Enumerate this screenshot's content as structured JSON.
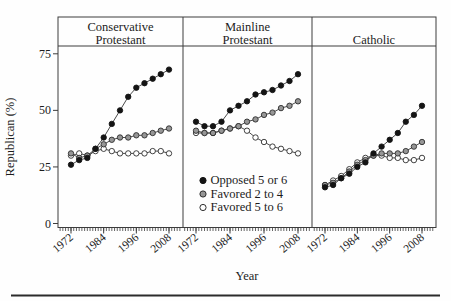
{
  "figure": {
    "xlabel": "Year",
    "ylabel": "Republican (%)"
  },
  "chart_data": {
    "type": "line",
    "x": [
      1972,
      1975,
      1978,
      1981,
      1984,
      1987,
      1990,
      1993,
      1996,
      1999,
      2002,
      2005,
      2008
    ],
    "xlabel": "Year",
    "ylabel": "Republican (%)",
    "ylim": [
      0,
      80
    ],
    "yticks": [
      0,
      25,
      50,
      75
    ],
    "xtick_years": [
      1972,
      1984,
      1996,
      2008
    ],
    "grid": false,
    "legend_position": "inside-middle-panel-lower-half",
    "legend": [
      {
        "label": "Opposed 5 or 6",
        "marker": "filled-black"
      },
      {
        "label": "Favored 2 to 4",
        "marker": "filled-gray"
      },
      {
        "label": "Favored 5 to 6",
        "marker": "open-white"
      }
    ],
    "panels": [
      {
        "title_lines": [
          "Conservative",
          "Protestant"
        ],
        "series": [
          {
            "name": "Opposed 5 or 6",
            "values": [
              26,
              28,
              29,
              33,
              38,
              44,
              50,
              56,
              60,
              62,
              64,
              66,
              68
            ]
          },
          {
            "name": "Favored 2 to 4",
            "values": [
              31,
              29,
              30,
              33,
              35,
              37,
              38,
              38,
              39,
              39,
              40,
              41,
              42
            ]
          },
          {
            "name": "Favored 5 to 6",
            "values": [
              30,
              31,
              30,
              32,
              33,
              32,
              31,
              31,
              31,
              31,
              32,
              32,
              31
            ]
          }
        ]
      },
      {
        "title_lines": [
          "Mainline",
          "Protestant"
        ],
        "series": [
          {
            "name": "Opposed 5 or 6",
            "values": [
              45,
              43,
              43,
              45,
              50,
              52,
              54,
              57,
              58,
              59,
              61,
              63,
              66
            ]
          },
          {
            "name": "Favored 2 to 4",
            "values": [
              41,
              40,
              40,
              41,
              42,
              43,
              45,
              46,
              48,
              49,
              51,
              52,
              54
            ]
          },
          {
            "name": "Favored 5 to 6",
            "values": [
              40,
              40,
              40,
              41,
              42,
              43,
              41,
              38,
              36,
              34,
              33,
              32,
              31
            ]
          }
        ]
      },
      {
        "title_lines": [
          "Catholic"
        ],
        "series": [
          {
            "name": "Opposed 5 or 6",
            "values": [
              16,
              17,
              20,
              22,
              25,
              27,
              31,
              34,
              37,
              40,
              45,
              48,
              52
            ]
          },
          {
            "name": "Favored 2 to 4",
            "values": [
              17,
              18,
              20,
              23,
              26,
              28,
              30,
              31,
              31,
              31,
              32,
              34,
              36
            ]
          },
          {
            "name": "Favored 5 to 6",
            "values": [
              17,
              19,
              21,
              24,
              27,
              29,
              30,
              30,
              29,
              29,
              28,
              28,
              29
            ]
          }
        ]
      }
    ]
  },
  "colors": {
    "background": "#fefefe",
    "frame": "#3d3d3d",
    "line": "#4a4a4a",
    "text": "#1c1c1c",
    "marker_black": "#141414",
    "marker_gray": "#969696",
    "marker_stroke": "#2e2e2e",
    "marker_open_fill": "#ffffff",
    "bottom_rule": "#2b2b2b"
  }
}
